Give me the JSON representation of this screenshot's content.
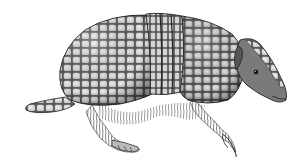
{
  "image": {
    "subject": "armadillo",
    "style": "black-and-white engraving illustration",
    "background": "#ffffff",
    "colors": {
      "shell_light": "#d8d8d8",
      "shell_mid": "#9a9a9a",
      "shell_dark": "#3a3a3a",
      "outline": "#1e1e1e",
      "hair": "#4a4a4a"
    },
    "parts": [
      "shell",
      "banded-middle",
      "head",
      "ear",
      "eye",
      "tail",
      "front-leg",
      "hind-leg",
      "belly-hair"
    ]
  }
}
